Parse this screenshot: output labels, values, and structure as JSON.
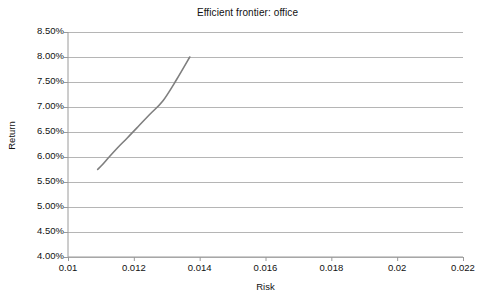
{
  "chart_data": {
    "type": "line",
    "title": "Efficient frontier: office",
    "xlabel": "Risk",
    "ylabel": "Return",
    "xlim": [
      0.01,
      0.022
    ],
    "ylim": [
      0.04,
      0.085
    ],
    "xticks": [
      0.01,
      0.012,
      0.014,
      0.016,
      0.018,
      0.02,
      0.022
    ],
    "xtick_labels": [
      "0.01",
      "0.012",
      "0.014",
      "0.016",
      "0.018",
      "0.02",
      "0.022"
    ],
    "yticks": [
      0.04,
      0.045,
      0.05,
      0.055,
      0.06,
      0.065,
      0.07,
      0.075,
      0.08,
      0.085
    ],
    "ytick_labels": [
      "4.00%",
      "4.50%",
      "5.00%",
      "5.50%",
      "6.00%",
      "6.50%",
      "7.00%",
      "7.50%",
      "8.00%",
      "8.50%"
    ],
    "grid": "horizontal",
    "legend": "none",
    "series": [
      {
        "name": "Efficient frontier",
        "color": "#7f7f7f",
        "x": [
          0.0109,
          0.01105,
          0.01125,
          0.0115,
          0.0118,
          0.01212,
          0.01248,
          0.01288,
          0.0133,
          0.0137
        ],
        "y": [
          0.0575,
          0.0585,
          0.06,
          0.0618,
          0.0638,
          0.066,
          0.0685,
          0.0712,
          0.0755,
          0.08
        ]
      }
    ]
  },
  "labels": {
    "title": "Efficient frontier: office",
    "x_axis_title": "Risk",
    "y_axis_title": "Return"
  }
}
